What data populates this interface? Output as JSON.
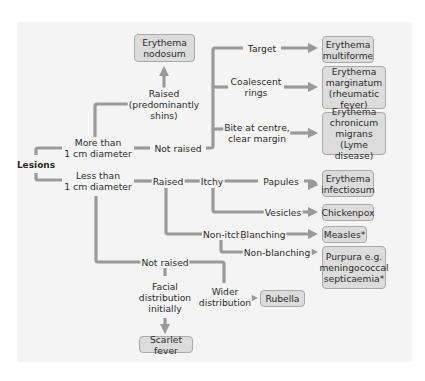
{
  "diagram": {
    "root": "Lesions",
    "colors": {
      "panel_bg": "#f4f4f4",
      "connector": "#9a9a9a",
      "box_fill": "#dcdcdc",
      "box_border": "#a9a9a9",
      "text": "#2b2b2b"
    },
    "labels": {
      "more_than": "More than\n1 cm diameter",
      "less_than": "Less than\n1 cm diameter",
      "raised_shins": "Raised\n(predominantly\nshins)",
      "not_raised_large": "Not raised",
      "target": "Target",
      "coalescent": "Coalescent\nrings",
      "bite": "Bite at centre,\nclear margin",
      "raised_small": "Raised",
      "itchy": "Itchy",
      "papules": "Papules",
      "vesicles": "Vesicles",
      "non_itchy": "Non-itchy",
      "blanching": "Blanching",
      "non_blanching": "Non-blanching",
      "not_raised_small": "Not raised",
      "facial": "Facial\ndistribution\ninitially",
      "wider": "Wider\ndistribution"
    },
    "outcomes": {
      "erythema_nodosum": "Erythema\nnodosum",
      "erythema_multiforme": "Erythema\nmultiforme",
      "erythema_marginatum": "Erythema\nmarginatum\n(rheumatic fever)",
      "erythema_chronicum": "Erythema\nchronicum migrans\n(Lyme disease)",
      "erythema_infectiosum": "Erythema\ninfectiosum",
      "chickenpox": "Chickenpox",
      "measles": "Measles*",
      "purpura": "Purpura e.g.\nmeningococcal\nsepticaemia*",
      "rubella": "Rubella",
      "scarlet_fever": "Scarlet fever"
    }
  }
}
